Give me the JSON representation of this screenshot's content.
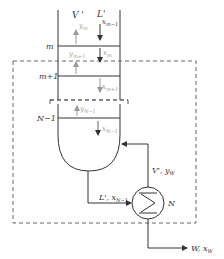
{
  "diagram": {
    "type": "distillation-column-stripping-section",
    "column": {
      "flows_top": {
        "vapor": "V '",
        "liquid": "L'"
      },
      "plates": [
        {
          "label": "m",
          "vapor_above": "y",
          "vapor_above_sub": "m",
          "liquid_in": "x",
          "liquid_in_sub": "m−1"
        },
        {
          "label": "m+1",
          "vapor_above": "y",
          "vapor_above_sub": "m+1",
          "liquid_in": "x",
          "liquid_in_sub": "m"
        },
        {
          "label": "N−1",
          "vapor_above": "y",
          "vapor_above_sub": "N−1",
          "liquid_in": "x",
          "liquid_in_sub": "m+1"
        }
      ],
      "liquid_below_last": {
        "text": "x",
        "sub": "N−1"
      }
    },
    "reboiler": {
      "label": "N",
      "vapor_out": {
        "text": "V', y",
        "sub": "W"
      },
      "liquid_in": {
        "text": "L', x",
        "sub": "N−1"
      }
    },
    "product": {
      "text": "W, x",
      "sub": "W"
    },
    "colors": {
      "line": "#333333",
      "dim": "#9a9a9a",
      "dashed": "#666666"
    }
  }
}
